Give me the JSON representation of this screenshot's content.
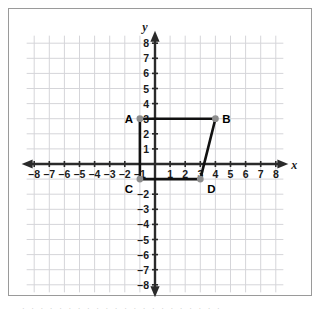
{
  "chart_data": {
    "type": "scatter",
    "title": "",
    "xlabel": "x",
    "ylabel": "y",
    "xlim": [
      -8.5,
      8.5
    ],
    "ylim": [
      -8.5,
      8.5
    ],
    "grid": true,
    "legend": null,
    "x_tick_labels": [
      "–8",
      "–7",
      "–6",
      "–5",
      "–4",
      "–3",
      "–2",
      "–1",
      "1",
      "2",
      "3",
      "4",
      "5",
      "6",
      "7",
      "8"
    ],
    "x_tick_values": [
      -8,
      -7,
      -6,
      -5,
      -4,
      -3,
      -2,
      -1,
      1,
      2,
      3,
      4,
      5,
      6,
      7,
      8
    ],
    "y_tick_labels": [
      "8",
      "7",
      "6",
      "5",
      "4",
      "3",
      "2",
      "1",
      "–2",
      "–3",
      "–4",
      "–5",
      "–6",
      "–7",
      "–8"
    ],
    "y_tick_values": [
      8,
      7,
      6,
      5,
      4,
      3,
      2,
      1,
      -2,
      -3,
      -4,
      -5,
      -6,
      -7,
      -8
    ],
    "points": [
      {
        "label": "A",
        "x": -1,
        "y": 3,
        "label_side": "left"
      },
      {
        "label": "B",
        "x": 4,
        "y": 3,
        "label_side": "right"
      },
      {
        "label": "C",
        "x": -1,
        "y": -1,
        "label_side": "left-below"
      },
      {
        "label": "D",
        "x": 3,
        "y": -1,
        "label_side": "right-below"
      }
    ],
    "polygon": {
      "name": "trapezoid-ABDC",
      "vertex_order": [
        "A",
        "B",
        "D",
        "C"
      ],
      "closed": true
    },
    "colors": {
      "grid": "#d5d5d9",
      "axis": "#2a2a2a",
      "shape_stroke": "#111111",
      "vertex_fill": "#8d8d8d",
      "frame": "#9a9a9a"
    }
  },
  "caption": {
    "text": "· · · · · · · · · · · · · · · · · · · · · ·"
  }
}
